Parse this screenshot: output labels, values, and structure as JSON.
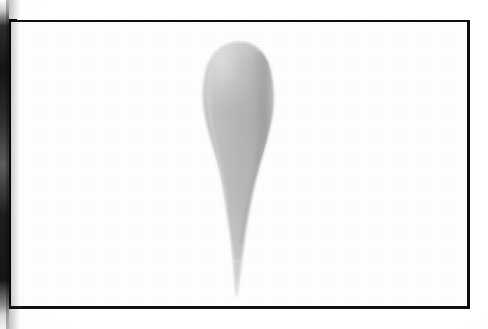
{
  "page": {
    "kind": "scanned-book-plate",
    "background_color": "#ffffff",
    "width": 488,
    "height": 329
  },
  "gutter": {
    "name": "binding-gutter-shadow",
    "side": "left",
    "color": "#141414",
    "width_px": 9
  },
  "plate": {
    "frame_color": "#0c0c0c",
    "frame_top_px": 2,
    "frame_right_px": 3,
    "frame_bottom_px": 3,
    "frame_left_px": 4,
    "field_color": "#ffffff",
    "caption": "",
    "label": "",
    "figure_number": ""
  },
  "specimen": {
    "name": "teardrop-specimen",
    "description": "elongated teardrop form with rounded bulbous apex and long tapering point",
    "orientation": "vertical, apex up, point down",
    "fill_light": "#c6c6c6",
    "fill_mid": "#b4b4b4",
    "fill_dark": "#a6a6a6",
    "highlight": "#d2d2d2",
    "edge_shadow": "#9a9a9a",
    "bounds": {
      "top_y": 42,
      "tip_y": 297,
      "widest_y": 95,
      "left_x": 205,
      "right_x": 273,
      "tip_x": 236
    }
  },
  "annotations": {
    "items": []
  }
}
